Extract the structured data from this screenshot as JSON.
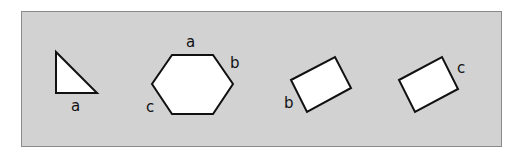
{
  "colors": {
    "panel": "#d2d2d2",
    "panel_border": "#8a8a8a",
    "shape_fill": "#ffffff",
    "stroke": "#111111"
  },
  "figures": [
    {
      "name": "right-triangle",
      "labels": [
        "a"
      ]
    },
    {
      "name": "hexagon",
      "labels": [
        "a",
        "b",
        "c"
      ]
    },
    {
      "name": "rectangle-1",
      "labels": [
        "b"
      ]
    },
    {
      "name": "rectangle-2",
      "labels": [
        "c"
      ]
    }
  ]
}
